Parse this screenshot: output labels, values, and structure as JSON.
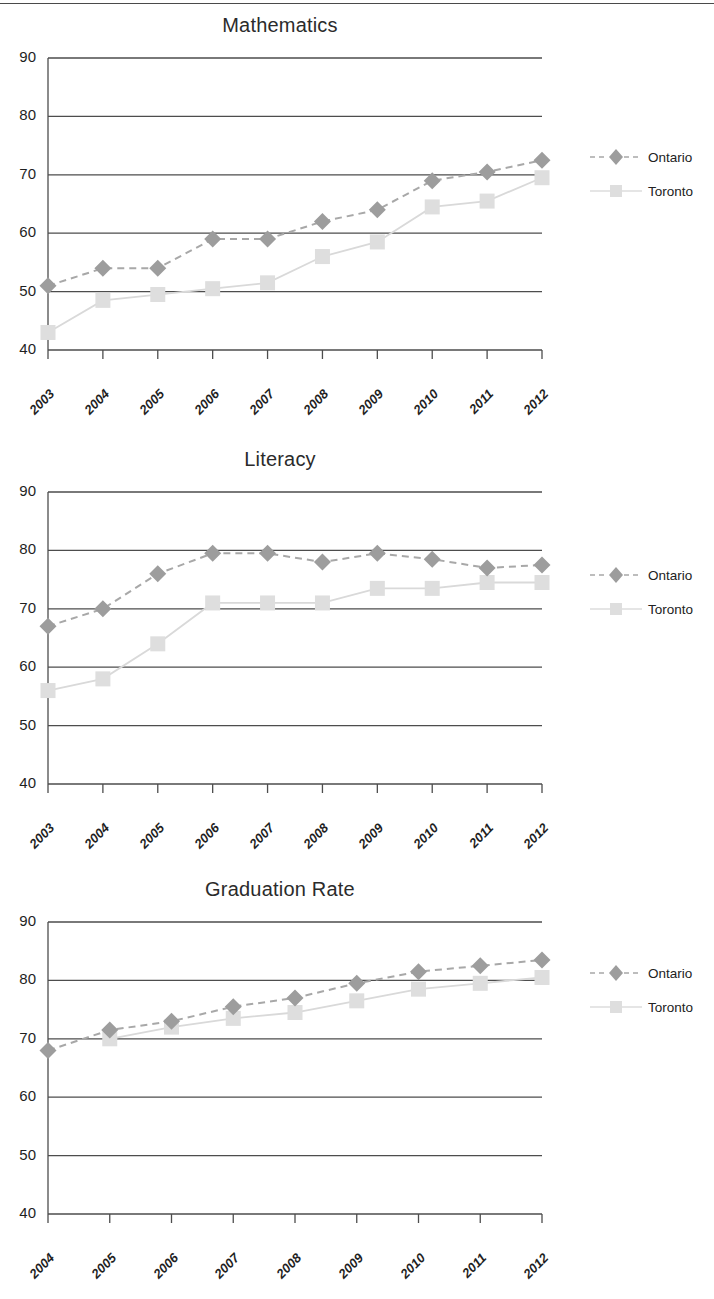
{
  "page": {
    "background": "#ffffff",
    "top_rule": true
  },
  "series_style": {
    "ontario": {
      "name": "Ontario",
      "color": "#9d9d9d",
      "line_color": "#a8a8a8",
      "marker": "diamond",
      "dash": "dashed"
    },
    "toronto": {
      "name": "Toronto",
      "color": "#dedede",
      "line_color": "#d9d9d9",
      "marker": "square",
      "dash": "solid"
    }
  },
  "charts": [
    {
      "id": "math",
      "title": "Mathematics",
      "legend": [
        {
          "label": "Ontario"
        },
        {
          "label": "Toronto"
        }
      ]
    },
    {
      "id": "lit",
      "title": "Literacy",
      "legend": [
        {
          "label": "Ontario"
        },
        {
          "label": "Toronto"
        }
      ]
    },
    {
      "id": "grad",
      "title": "Graduation Rate",
      "legend": [
        {
          "label": "Ontario"
        },
        {
          "label": "Toronto"
        }
      ]
    }
  ],
  "chart_data": [
    {
      "type": "line",
      "title": "Mathematics",
      "xlabel": "",
      "ylabel": "",
      "categories": [
        "2003",
        "2004",
        "2005",
        "2006",
        "2007",
        "2008",
        "2009",
        "2010",
        "2011",
        "2012"
      ],
      "ylim": [
        40,
        90
      ],
      "yticks": [
        40,
        50,
        60,
        70,
        80,
        90
      ],
      "grid": true,
      "legend_position": "right",
      "series": [
        {
          "name": "Ontario",
          "values": [
            51.0,
            54.0,
            54.0,
            59.0,
            59.0,
            62.0,
            64.0,
            69.0,
            70.5,
            72.5
          ]
        },
        {
          "name": "Toronto",
          "values": [
            43.0,
            48.5,
            49.5,
            50.5,
            51.5,
            56.0,
            58.5,
            64.5,
            65.5,
            69.5
          ]
        }
      ]
    },
    {
      "type": "line",
      "title": "Literacy",
      "xlabel": "",
      "ylabel": "",
      "categories": [
        "2003",
        "2004",
        "2005",
        "2006",
        "2007",
        "2008",
        "2009",
        "2010",
        "2011",
        "2012"
      ],
      "ylim": [
        40,
        90
      ],
      "yticks": [
        40,
        50,
        60,
        70,
        80,
        90
      ],
      "grid": true,
      "legend_position": "right",
      "series": [
        {
          "name": "Ontario",
          "values": [
            67.0,
            70.0,
            76.0,
            79.5,
            79.5,
            78.0,
            79.5,
            78.5,
            77.0,
            77.5
          ]
        },
        {
          "name": "Toronto",
          "values": [
            56.0,
            58.0,
            64.0,
            71.0,
            71.0,
            71.0,
            73.5,
            73.5,
            74.5,
            74.5
          ]
        }
      ]
    },
    {
      "type": "line",
      "title": "Graduation Rate",
      "xlabel": "",
      "ylabel": "",
      "categories": [
        "2004",
        "2005",
        "2006",
        "2007",
        "2008",
        "2009",
        "2010",
        "2011",
        "2012"
      ],
      "ylim": [
        40,
        90
      ],
      "yticks": [
        40,
        50,
        60,
        70,
        80,
        90
      ],
      "grid": true,
      "legend_position": "right",
      "series": [
        {
          "name": "Ontario",
          "values": [
            68.0,
            71.5,
            73.0,
            75.5,
            77.0,
            79.5,
            81.5,
            82.5,
            83.5
          ]
        },
        {
          "name": "Toronto",
          "values": [
            null,
            70.0,
            72.0,
            73.5,
            74.5,
            76.5,
            78.5,
            79.5,
            80.5
          ]
        }
      ]
    }
  ]
}
